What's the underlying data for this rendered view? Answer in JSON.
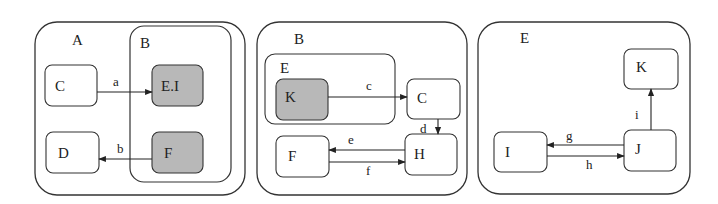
{
  "colors": {
    "stroke": "#333333",
    "shaded": "#b8b8b8",
    "background": "#ffffff"
  },
  "panels": [
    {
      "title": "A",
      "states": [
        {
          "id": "C",
          "label": "C",
          "shaded": false
        },
        {
          "id": "D",
          "label": "D",
          "shaded": false
        }
      ],
      "substate": {
        "title": "B",
        "states": [
          {
            "id": "EI",
            "label": "E.I",
            "shaded": true
          },
          {
            "id": "F",
            "label": "F",
            "shaded": true
          }
        ]
      },
      "transitions": [
        {
          "label": "a",
          "from": "C",
          "to": "E.I"
        },
        {
          "label": "b",
          "from": "F",
          "to": "D"
        }
      ]
    },
    {
      "title": "B",
      "substate": {
        "title": "E",
        "states": [
          {
            "id": "K",
            "label": "K",
            "shaded": true
          }
        ]
      },
      "states": [
        {
          "id": "C",
          "label": "C",
          "shaded": false
        },
        {
          "id": "H",
          "label": "H",
          "shaded": false
        },
        {
          "id": "F",
          "label": "F",
          "shaded": false
        }
      ],
      "transitions": [
        {
          "label": "c",
          "from": "K",
          "to": "C"
        },
        {
          "label": "d",
          "from": "C",
          "to": "H"
        },
        {
          "label": "e",
          "from": "H",
          "to": "F"
        },
        {
          "label": "f",
          "from": "F",
          "to": "H"
        }
      ]
    },
    {
      "title": "E",
      "states": [
        {
          "id": "K",
          "label": "K",
          "shaded": false
        },
        {
          "id": "I",
          "label": "I",
          "shaded": false
        },
        {
          "id": "J",
          "label": "J",
          "shaded": false
        }
      ],
      "transitions": [
        {
          "label": "g",
          "from": "J",
          "to": "I"
        },
        {
          "label": "h",
          "from": "I",
          "to": "J"
        },
        {
          "label": "i",
          "from": "J",
          "to": "K"
        }
      ]
    }
  ]
}
